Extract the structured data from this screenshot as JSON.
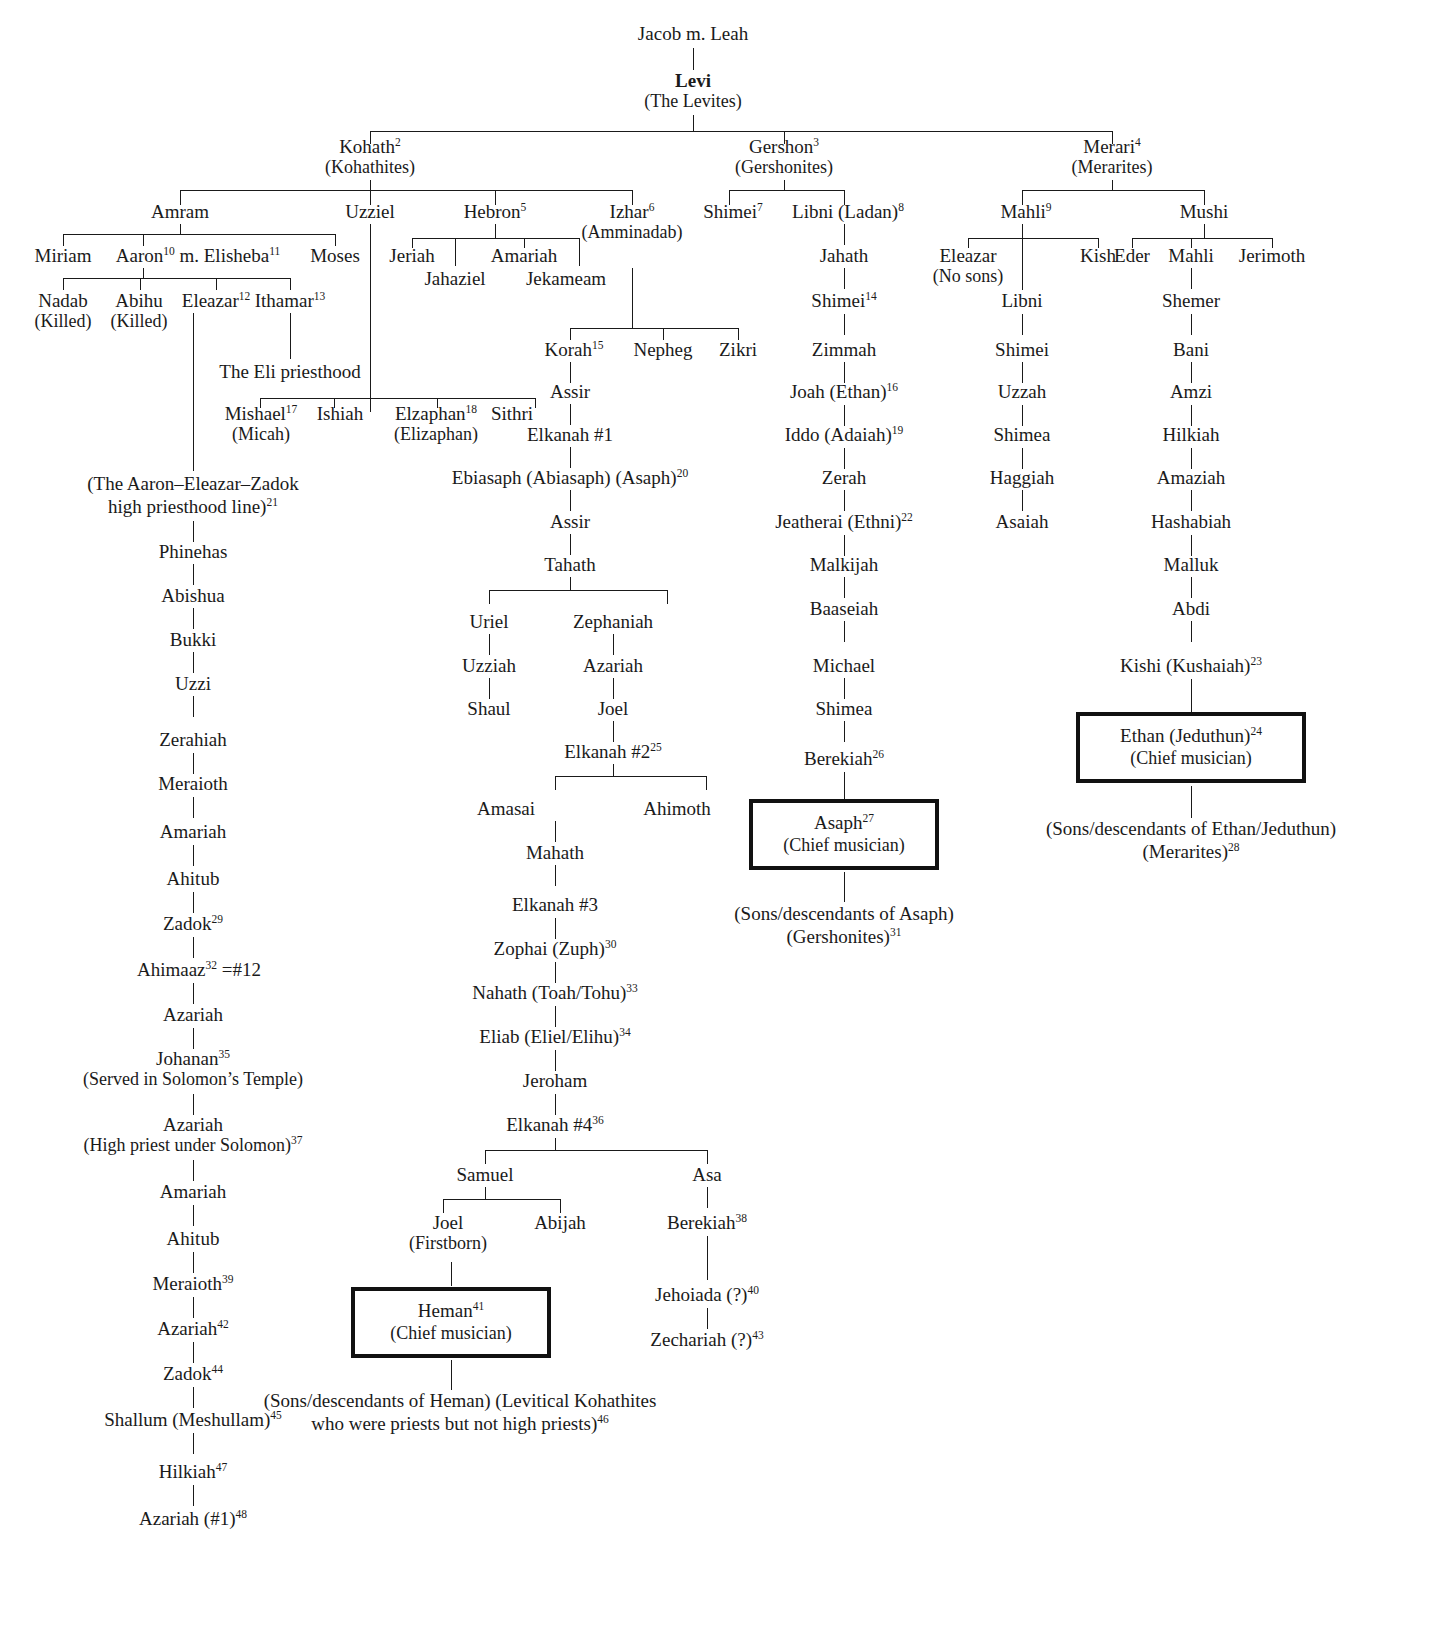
{
  "nodes": {
    "jacob": "Jacob m. Leah",
    "levi": "Levi",
    "levi_sub": "(The Levites)",
    "kohath": "Kohath",
    "kohath_sup": "2",
    "kohath_sub": "(Kohathites)",
    "gershon": "Gershon",
    "gershon_sup": "3",
    "gershon_sub": "(Gershonites)",
    "merari": "Merari",
    "merari_sup": "4",
    "merari_sub": "(Merarites)",
    "amram": "Amram",
    "uzziel": "Uzziel",
    "hebron": "Hebron",
    "hebron_sup": "5",
    "izhar": "Izhar",
    "izhar_sup": "6",
    "izhar_sub": "(Amminadab)",
    "miriam": "Miriam",
    "aaron": "Aaron",
    "aaron_sup": "10",
    "aaron_m": " m. Elisheba",
    "aaron_m_sup": "11",
    "moses": "Moses",
    "jeriah": "Jeriah",
    "jahaziel": "Jahaziel",
    "amariah_h": "Amariah",
    "jekameam": "Jekameam",
    "shimei7": "Shimei",
    "shimei7_sup": "7",
    "libni_ladan": "Libni (Ladan)",
    "libni_ladan_sup": "8",
    "mahli9": "Mahli",
    "mahli9_sup": "9",
    "mushi": "Mushi",
    "nadab": "Nadab",
    "nadab_sub": "(Killed)",
    "abihu": "Abihu",
    "abihu_sub": "(Killed)",
    "eleazar12": "Eleazar",
    "eleazar12_sup": "12",
    "ithamar": "Ithamar",
    "ithamar_sup": "13",
    "eli_priesthood": "The Eli priesthood",
    "eleazar_nosons": "Eleazar",
    "eleazar_nosons_sub": "(No sons)",
    "kish": "Kish",
    "eder": "Eder",
    "mahli_m": "Mahli",
    "jerimoth": "Jerimoth",
    "jahath": "Jahath",
    "mishael": "Mishael",
    "mishael_sup": "17",
    "mishael_sub": "(Micah)",
    "ishiah": "Ishiah",
    "elzaphan": "Elzaphan",
    "elzaphan_sup": "18",
    "elzaphan_sub": "(Elizaphan)",
    "sithri": "Sithri",
    "korah": "Korah",
    "korah_sup": "15",
    "nepheg": "Nepheg",
    "zikri": "Zikri",
    "shimei14": "Shimei",
    "shimei14_sup": "14",
    "libni_m": "Libni",
    "shemer": "Shemer",
    "assir1": "Assir",
    "zimmah": "Zimmah",
    "shimei_m": "Shimei",
    "bani": "Bani",
    "elkanah1": "Elkanah #1",
    "joah_ethan": "Joah (Ethan)",
    "joah_ethan_sup": "16",
    "uzzah": "Uzzah",
    "amzi": "Amzi",
    "ebiasaph": "Ebiasaph (Abiasaph) (Asaph)",
    "ebiasaph_sup": "20",
    "iddo_adaiah": "Iddo (Adaiah)",
    "iddo_adaiah_sup": "19",
    "shimea_m": "Shimea",
    "hilkiah_m": "Hilkiah",
    "aaron_line": "(The Aaron–Eleazar–Zadok",
    "aaron_line2": "high priesthood line)",
    "aaron_line_sup": "21",
    "assir2": "Assir",
    "zerah": "Zerah",
    "haggiah": "Haggiah",
    "amaziah": "Amaziah",
    "phinehas": "Phinehas",
    "tahath": "Tahath",
    "jeatherai": "Jeatherai (Ethni)",
    "jeatherai_sup": "22",
    "asaiah": "Asaiah",
    "hashabiah": "Hashabiah",
    "abishua": "Abishua",
    "uriel": "Uriel",
    "zephaniah": "Zephaniah",
    "malkijah": "Malkijah",
    "malluk": "Malluk",
    "bukki": "Bukki",
    "uzziah": "Uzziah",
    "azariah_z": "Azariah",
    "baaseiah": "Baaseiah",
    "abdi": "Abdi",
    "uzzi": "Uzzi",
    "shaul": "Shaul",
    "joel_z": "Joel",
    "michael": "Michael",
    "kishi": "Kishi (Kushaiah)",
    "kishi_sup": "23",
    "zerahiah": "Zerahiah",
    "shimea_g": "Shimea",
    "elkanah2": "Elkanah #2",
    "elkanah2_sup": "25",
    "meraioth": "Meraioth",
    "berekiah26": "Berekiah",
    "berekiah26_sup": "26",
    "ethan_box": "Ethan (Jeduthun)",
    "ethan_box_sup": "24",
    "ethan_box_sub": "(Chief musician)",
    "amariah1": "Amariah",
    "amasai": "Amasai",
    "ahimoth": "Ahimoth",
    "ahitub1": "Ahitub",
    "mahath": "Mahath",
    "asaph_box": "Asaph",
    "asaph_box_sup": "27",
    "asaph_box_sub": "(Chief musician)",
    "ethan_desc": "(Sons/descendants of Ethan/Jeduthun)",
    "ethan_desc2": "(Merarites)",
    "ethan_desc_sup": "28",
    "zadok29": "Zadok",
    "zadok29_sup": "29",
    "elkanah3": "Elkanah #3",
    "ahimaaz": "Ahimaaz",
    "ahimaaz_sup": "32",
    "ahimaaz_eq": " =#12",
    "zophai": "Zophai (Zuph)",
    "zophai_sup": "30",
    "asaph_desc": "(Sons/descendants of Asaph)",
    "asaph_desc2": "(Gershonites)",
    "asaph_desc_sup": "31",
    "azariah_a": "Azariah",
    "nahath": "Nahath (Toah/Tohu)",
    "nahath_sup": "33",
    "johanan": "Johanan",
    "johanan_sup": "35",
    "johanan_sub": "(Served in Solomon’s Temple)",
    "eliab": "Eliab (Eliel/Elihu)",
    "eliab_sup": "34",
    "jeroham": "Jeroham",
    "azariah_hp": "Azariah",
    "azariah_hp_sub": "(High priest under Solomon)",
    "azariah_hp_sup": "37",
    "elkanah4": "Elkanah #4",
    "elkanah4_sup": "36",
    "amariah2": "Amariah",
    "samuel": "Samuel",
    "asa": "Asa",
    "ahitub2": "Ahitub",
    "joel_s": "Joel",
    "joel_s_sub": "(Firstborn)",
    "abijah": "Abijah",
    "berekiah38": "Berekiah",
    "berekiah38_sup": "38",
    "meraioth39": "Meraioth",
    "meraioth39_sup": "39",
    "azariah42": "Azariah",
    "azariah42_sup": "42",
    "jehoiada": "Jehoiada (?)",
    "jehoiada_sup": "40",
    "heman_box": "Heman",
    "heman_box_sup": "41",
    "heman_box_sub": "(Chief musician)",
    "zadok44": "Zadok",
    "zadok44_sup": "44",
    "zechariah": "Zechariah (?)",
    "zechariah_sup": "43",
    "shallum": "Shallum (Meshullam)",
    "shallum_sup": "45",
    "heman_desc": "(Sons/descendants of Heman) (Levitical Kohathites",
    "heman_desc2": "who were priests but not high priests)",
    "heman_desc_sup": "46",
    "hilkiah47": "Hilkiah",
    "hilkiah47_sup": "47",
    "azariah48": "Azariah (#1)",
    "azariah48_sup": "48"
  }
}
